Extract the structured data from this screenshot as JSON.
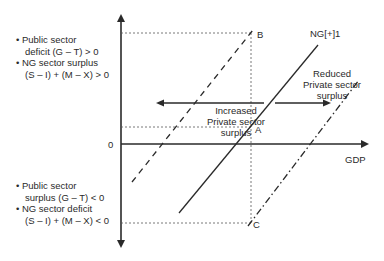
{
  "diagram": {
    "type": "sectoral-balance",
    "top_left_annotations": [
      "• Public sector",
      "deficit (G – T) > 0",
      "• NG sector surplus",
      "(S – I) + (M – X) > 0"
    ],
    "bottom_left_annotations": [
      "• Public sector",
      "surplus (G – T) < 0",
      "• NG sector deficit",
      "(S – I) + (M – X) < 0"
    ],
    "y_axis_zero_label": "0",
    "x_axis_label": "GDP",
    "line_label": "NG[+]1",
    "points": {
      "a": "A",
      "b": "B",
      "c": "C"
    },
    "left_arrow_label": [
      "Increased",
      "Private sector",
      "surplus"
    ],
    "right_arrow_label": [
      "Reduced",
      "Private sector",
      "surplus"
    ],
    "colors": {
      "ink": "#2a2a2a",
      "background": "#ffffff"
    }
  }
}
